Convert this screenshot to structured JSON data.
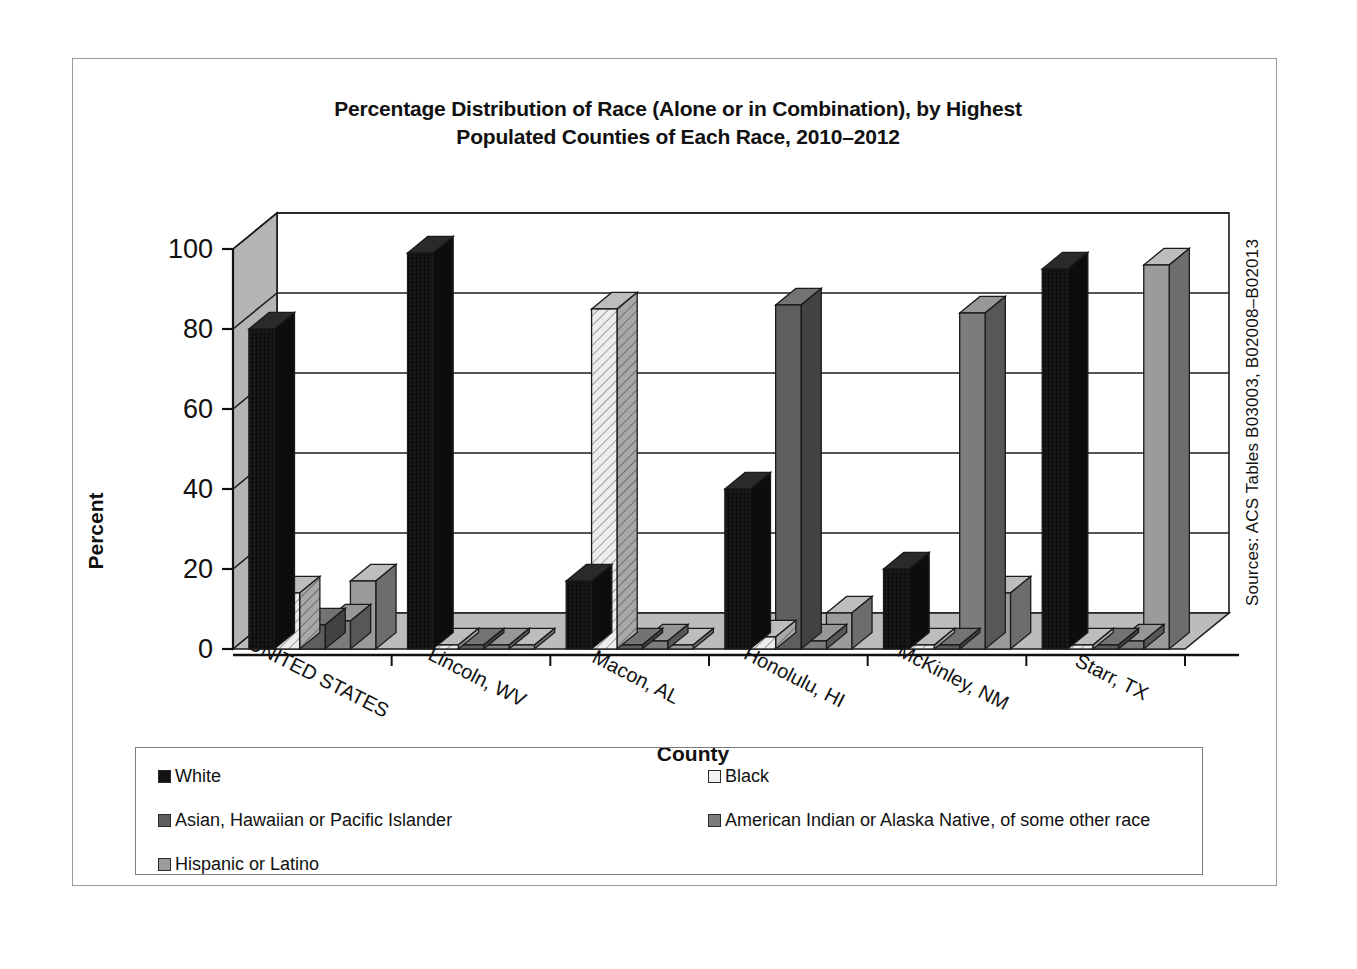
{
  "chart_data": {
    "type": "bar",
    "title": "Percentage Distribution of Race (Alone or in Combination), by Highest Populated Counties of Each Race, 2010–2012",
    "title_line1": "Percentage Distribution of Race (Alone or in Combination), by Highest",
    "title_line2": "Populated Counties of Each Race, 2010–2012",
    "xlabel": "County",
    "ylabel": "Percent",
    "ylim": [
      0,
      100
    ],
    "yticks": [
      0,
      20,
      40,
      60,
      80,
      100
    ],
    "ytick_labels": [
      "0",
      "20",
      "40",
      "60",
      "80",
      "100"
    ],
    "grid": true,
    "legend_position": "bottom",
    "style": "3d-clustered-column",
    "categories": [
      "UNITED STATES",
      "Lincoln, WV",
      "Macon, AL",
      "Honolulu, HI",
      "McKinley, NM",
      "Starr, TX"
    ],
    "series": [
      {
        "name": "White",
        "color": "#131313",
        "pattern": "solid",
        "values": [
          80,
          99,
          17,
          40,
          20,
          95
        ]
      },
      {
        "name": "Black",
        "color": "#e8e8e8",
        "pattern": "diagonal-hatch",
        "values": [
          14,
          1,
          85,
          3,
          1,
          1
        ]
      },
      {
        "name": "Asian, Hawaiian or Pacific Islander",
        "color": "#5e5e5e",
        "pattern": "solid",
        "values": [
          6,
          1,
          1,
          86,
          1,
          1
        ]
      },
      {
        "name": "American Indian or Alaska Native, of some other race",
        "color": "#7c7c7c",
        "pattern": "solid",
        "values": [
          7,
          1,
          2,
          2,
          84,
          2
        ]
      },
      {
        "name": "Hispanic or Latino",
        "color": "#9b9b9b",
        "pattern": "solid",
        "values": [
          17,
          1,
          1,
          9,
          14,
          96
        ]
      }
    ],
    "source_note": "Sources: ACS Tables B03003, B02008–B02013"
  },
  "legend": {
    "items": [
      {
        "label": "White",
        "swatch": "#131313"
      },
      {
        "label": "Black",
        "swatch": "#f2f2f2"
      },
      {
        "label": "Asian, Hawaiian or Pacific Islander",
        "swatch": "#5e5e5e"
      },
      {
        "label": "American Indian or Alaska Native, of some other race",
        "swatch": "#7c7c7c"
      },
      {
        "label": "Hispanic or Latino",
        "swatch": "#9b9b9b"
      }
    ]
  },
  "colors": {
    "plot_wall": "#b4b4b4",
    "plot_floor": "#bcbcbc",
    "plot_back": "#ffffff",
    "frame_border": "#9a9a9a",
    "gridline": "#1b1b1b",
    "text": "#111111"
  }
}
